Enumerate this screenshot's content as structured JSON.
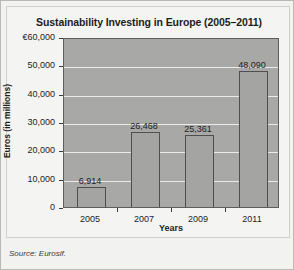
{
  "figure": {
    "source_note": "Source: Eurosif."
  },
  "chart_data": {
    "type": "bar",
    "title": "Sustainability Investing in Europe (2005–2011)",
    "xlabel": "Years",
    "ylabel": "Euros (in millions)",
    "categories": [
      "2005",
      "2007",
      "2009",
      "2011"
    ],
    "values": [
      6914,
      25361,
      25361,
      48090
    ],
    "value_labels": [
      "6,914",
      "26,468",
      "25,361",
      "48,090"
    ],
    "series": [
      {
        "name": "Sustainability investing",
        "values": [
          6914,
          26468,
          25361,
          48090
        ]
      }
    ],
    "ylim": [
      0,
      60000
    ],
    "yticks": [
      0,
      10000,
      20000,
      30000,
      40000,
      50000,
      60000
    ],
    "ytick_labels": [
      "0",
      "10,000",
      "20,000",
      "30,000",
      "40,000",
      "50,000",
      "€60,000"
    ],
    "grid": true,
    "legend": "none",
    "colors": {
      "bar_fill": "#a4a4a2",
      "bar_edge": "#4e4e4c",
      "plot_background": "#a8a8a6",
      "gridline": "#ebebeb",
      "figure_background": "#f2f2f0",
      "text": "#1d1d1d"
    }
  }
}
